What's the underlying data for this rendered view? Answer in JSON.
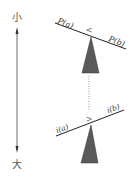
{
  "diagram": {
    "scale": {
      "top_label": "小",
      "bottom_label": "大",
      "direction": "downward-arrow"
    },
    "top_balance": {
      "left_label": "P(a)",
      "right_label": "P(b)",
      "comparison": "<",
      "tilt": "left-up, right-down"
    },
    "bottom_balance": {
      "left_label": "i(a)",
      "right_label": "i(b)",
      "comparison": ">",
      "tilt": "left-down, right-up"
    },
    "connector": "dotted-vertical-line",
    "colors": {
      "fulcrum": "#5a5a5a",
      "beam": "#222222",
      "arrow": "#444444",
      "text": "#333333"
    }
  }
}
